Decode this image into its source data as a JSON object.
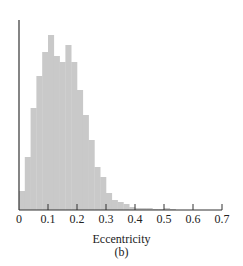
{
  "chart_data": {
    "type": "bar",
    "title": "",
    "xlabel": "Eccentricity",
    "ylabel": "",
    "panel_label": "(b)",
    "bin_width": 0.02,
    "xlim": [
      0,
      0.7
    ],
    "x_ticks": [
      "0",
      "0.1",
      "0.2",
      "0.3",
      "0.4",
      "0.5",
      "0.6",
      "0.7"
    ],
    "y_ticks": [],
    "grid": false,
    "legend": null,
    "bar_color": "#c9c9c9",
    "categories": [
      "0.00",
      "0.02",
      "0.04",
      "0.06",
      "0.08",
      "0.10",
      "0.12",
      "0.14",
      "0.16",
      "0.18",
      "0.20",
      "0.22",
      "0.24",
      "0.26",
      "0.28",
      "0.30",
      "0.32",
      "0.34",
      "0.36",
      "0.38",
      "0.40",
      "0.42",
      "0.44",
      "0.46",
      "0.48",
      "0.50",
      "0.52"
    ],
    "values": [
      19,
      53,
      102,
      134,
      158,
      175,
      154,
      148,
      165,
      148,
      120,
      95,
      70,
      43,
      33,
      17,
      10,
      8,
      6,
      3,
      2,
      2,
      2,
      1,
      1,
      2,
      1
    ],
    "values_note": "relative bar heights (unlabeled y-axis, arbitrary units)"
  },
  "labels": {
    "xlabel": "Eccentricity",
    "panel": "(b)"
  }
}
